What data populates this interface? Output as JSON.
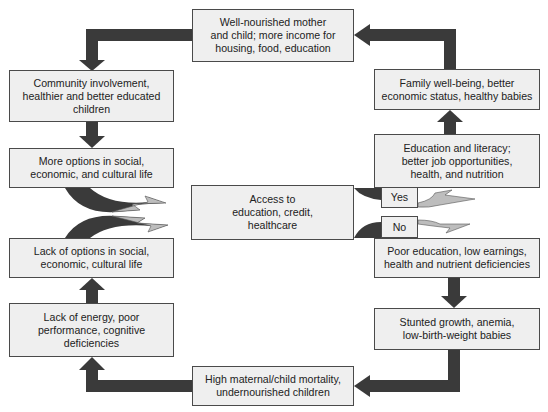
{
  "diagram": {
    "type": "cycle-flowchart",
    "colors": {
      "box_fill": "#efefef",
      "box_border": "#4a4a4a",
      "arrow_dark": "#3a3a3a",
      "arrow_light": "#bdbdbd"
    },
    "top": {
      "label": "Well-nourished mother\nand child; more income for\nhousing, food, education"
    },
    "center": {
      "label": "Access to\neducation, credit,\nhealthcare"
    },
    "decision": {
      "yes": "Yes",
      "no": "No"
    },
    "left": [
      {
        "label": "Community involvement,\nhealthier and better educated\nchildren"
      },
      {
        "label": "More options in social,\neconomic, and cultural life"
      },
      {
        "label": "Lack of options in social,\neconomic, cultural life"
      },
      {
        "label": "Lack of energy, poor\nperformance, cognitive\ndeficiencies"
      }
    ],
    "right": [
      {
        "label": "Family well-being, better\neconomic status, healthy babies"
      },
      {
        "label": "Education and literacy;\nbetter job opportunities,\nhealth, and nutrition"
      },
      {
        "label": "Poor education, low earnings,\nhealth and nutrient deficiencies"
      },
      {
        "label": "Stunted growth, anemia,\nlow-birth-weight babies"
      }
    ],
    "bottom": {
      "label": "High maternal/child mortality,\nundernourished children"
    }
  }
}
